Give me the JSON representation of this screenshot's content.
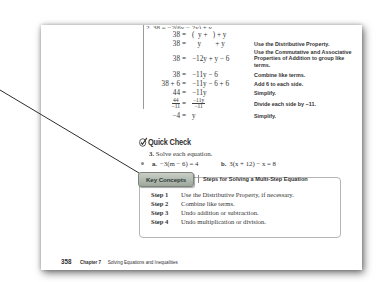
{
  "page": {
    "work": {
      "cut_line": "2. 38 = −2(6y − 2y) + y",
      "rows": [
        {
          "lhs": "38",
          "eq": "=",
          "rhs": "(  y +   ) + y",
          "reason": ""
        },
        {
          "lhs": "38",
          "eq": "=",
          "rhs": "   y        + y",
          "reason": "Use the Distributive Property."
        },
        {
          "lhs": "38",
          "eq": "=",
          "rhs": "−12y + y − 6",
          "reason": "Use the Commutative and Associative Properties of Addition to group like terms."
        },
        {
          "lhs": "38",
          "eq": "=",
          "rhs": "−11y − 6",
          "reason": "Combine like terms."
        },
        {
          "lhs": "38 + 6",
          "eq": "=",
          "rhs": "−11y − 6 + 6",
          "reason": "Add 6 to each side."
        },
        {
          "lhs": "44",
          "eq": "=",
          "rhs": "−11y",
          "reason": "Simplify."
        },
        {
          "lhs_num": "44",
          "lhs_den": "−11",
          "eq": "=",
          "rhs_num": "−11y",
          "rhs_den": "−11",
          "reason": "Divide each side by −11."
        },
        {
          "lhs": "−4",
          "eq": "=",
          "rhs": "y",
          "reason": "Simplify."
        }
      ]
    },
    "quick_check": {
      "title": "Quick Check",
      "icon": "checkmark-pencil-icon",
      "item_number": "3.",
      "item_text": "Solve each equation.",
      "parts": [
        {
          "label": "a.",
          "text": "−3(m − 6) = 4"
        },
        {
          "label": "b.",
          "text": "3(x + 12) − x = 8"
        }
      ]
    },
    "key_concepts": {
      "tab_label": "Key Concepts",
      "title": "Steps for Solving a Multi-Step Equation",
      "steps": [
        {
          "label": "Step 1",
          "text": "Use the Distributive Property, if necessary."
        },
        {
          "label": "Step 2",
          "text": "Combine like terms."
        },
        {
          "label": "Step 3",
          "text": "Undo addition or subtraction."
        },
        {
          "label": "Step 4",
          "text": "Undo multiplication or division."
        }
      ]
    },
    "footer": {
      "page_number": "358",
      "chapter": "Chapter 7",
      "chapter_title": "Solving Equations and Inequalities"
    }
  },
  "colors": {
    "tab_bg": "#a9b1a6",
    "text": "#333333",
    "box_border": "#b5b5b5",
    "pointer_line": "#333333"
  }
}
